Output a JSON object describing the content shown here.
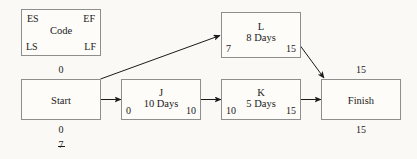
{
  "diagram": {
    "background_color": "#faf9f5",
    "border_color": "#8e8e8e",
    "text_color": "#1a1a1a"
  },
  "legend": {
    "es_label": "ES",
    "ef_label": "EF",
    "code_label": "Code",
    "ls_label": "LS",
    "lf_label": "LF"
  },
  "nodes": {
    "start": {
      "name": "Start",
      "top_value": "0",
      "bottom_value": "0",
      "extra_value": "7"
    },
    "j": {
      "name": "J",
      "duration": "10 Days",
      "es": "0",
      "ef": "10"
    },
    "k": {
      "name": "K",
      "duration": "5 Days",
      "es": "10",
      "ef": "15"
    },
    "l": {
      "name": "L",
      "duration": "8 Days",
      "es": "7",
      "ef": "15"
    },
    "finish": {
      "name": "Finish",
      "top_value": "15",
      "bottom_value": "15"
    }
  },
  "edges": [
    {
      "id": "start-to-j",
      "from": "Start",
      "to": "J",
      "style": "straight-arrow"
    },
    {
      "id": "start-to-l",
      "from": "Start",
      "to": "L",
      "style": "diagonal-arrow"
    },
    {
      "id": "j-to-k",
      "from": "J",
      "to": "K",
      "style": "straight-arrow"
    },
    {
      "id": "k-to-finish",
      "from": "K",
      "to": "Finish",
      "style": "straight-arrow"
    },
    {
      "id": "l-to-finish",
      "from": "L",
      "to": "Finish",
      "style": "diagonal-arrow"
    }
  ]
}
